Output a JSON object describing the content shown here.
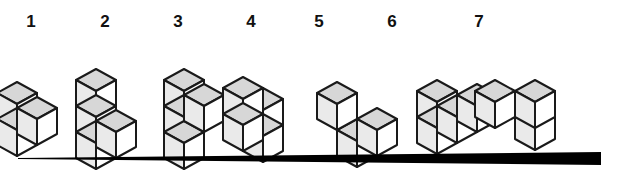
{
  "figure": {
    "background_color": "#ffffff",
    "line_color": "#1a1a1a",
    "colors": {
      "top_face": "#d7d7d7",
      "left_face": "#eaeaea",
      "right_face": "#ffffff"
    },
    "cube": {
      "half_width": 20,
      "half_height": 11,
      "side_height": 26
    },
    "items": [
      {
        "id": "shape-1",
        "label": "1",
        "label_x": 31,
        "label_y": 27,
        "cube_count": 3,
        "origin_x": 17,
        "origin_y": 130,
        "cubes": [
          {
            "x": 0,
            "y": 0,
            "z": 0
          },
          {
            "x": 0,
            "y": 1,
            "z": 0
          },
          {
            "x": 1,
            "y": 0,
            "z": 0
          }
        ]
      },
      {
        "id": "shape-2",
        "label": "2",
        "label_x": 105,
        "label_y": 27,
        "cube_count": 4,
        "origin_x": 96,
        "origin_y": 143,
        "cubes": [
          {
            "x": 0,
            "y": 0,
            "z": 0
          },
          {
            "x": 0,
            "y": 1,
            "z": 0
          },
          {
            "x": 0,
            "y": 2,
            "z": 0
          },
          {
            "x": 1,
            "y": 0,
            "z": 0
          }
        ]
      },
      {
        "id": "shape-3",
        "label": "3",
        "label_x": 178,
        "label_y": 27,
        "cube_count": 4,
        "origin_x": 184,
        "origin_y": 143,
        "cubes": [
          {
            "x": 0,
            "y": 0,
            "z": 0
          },
          {
            "x": 0,
            "y": 1,
            "z": 0
          },
          {
            "x": 0,
            "y": 2,
            "z": 0
          },
          {
            "x": 1,
            "y": 1,
            "z": 0
          }
        ]
      },
      {
        "id": "shape-4",
        "label": "4",
        "label_x": 251,
        "label_y": 27,
        "cube_count": 4,
        "origin_x": 263,
        "origin_y": 136,
        "cubes": [
          {
            "x": 0,
            "y": 0,
            "z": 0
          },
          {
            "x": 0,
            "y": 1,
            "z": 0
          },
          {
            "x": 0,
            "y": 0,
            "z": 1
          },
          {
            "x": 0,
            "y": 1,
            "z": 1
          }
        ]
      },
      {
        "id": "shape-5",
        "label": "5",
        "label_x": 319,
        "label_y": 27,
        "cube_count": 3,
        "origin_x": 357,
        "origin_y": 141,
        "cubes": [
          {
            "x": 0,
            "y": 0,
            "z": 0
          },
          {
            "x": 1,
            "y": 0,
            "z": 0
          },
          {
            "x": 0,
            "y": 1,
            "z": 1
          }
        ]
      },
      {
        "id": "shape-6",
        "label": "6",
        "label_x": 392,
        "label_y": 27,
        "cube_count": 4,
        "origin_x": 437,
        "origin_y": 128,
        "cubes": [
          {
            "x": 0,
            "y": 0,
            "z": 0
          },
          {
            "x": 1,
            "y": 0,
            "z": 0
          },
          {
            "x": 2,
            "y": 0,
            "z": 0
          },
          {
            "x": 0,
            "y": 1,
            "z": 0
          }
        ]
      },
      {
        "id": "shape-7",
        "label": "7",
        "label_x": 479,
        "label_y": 27,
        "cube_count": 3,
        "origin_x": 535,
        "origin_y": 124,
        "cubes": [
          {
            "x": 0,
            "y": 0,
            "z": 0
          },
          {
            "x": 1,
            "y": 0,
            "z": 1
          },
          {
            "x": 0,
            "y": 0,
            "z": 2
          }
        ]
      }
    ],
    "bottom_rule": {
      "name": "tapered-baseline",
      "x_start": 18,
      "x_end": 601,
      "y": 158,
      "thickness_start": 1,
      "thickness_end": 7,
      "color": "#000000"
    }
  }
}
